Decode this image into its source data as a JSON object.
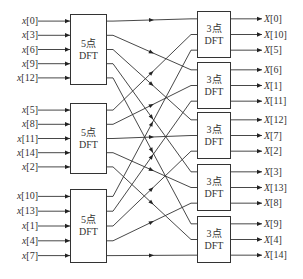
{
  "diagram": {
    "type": "signal-flow",
    "stage1": {
      "block_label_line1": "5点",
      "block_label_line2": "DFT",
      "blocks": [
        {
          "inputs": [
            "x[0]",
            "x[3]",
            "x[6]",
            "x[9]",
            "x[12]"
          ]
        },
        {
          "inputs": [
            "x[5]",
            "x[8]",
            "x[11]",
            "x[14]",
            "x[2]"
          ]
        },
        {
          "inputs": [
            "x[10]",
            "x[13]",
            "x[1]",
            "x[4]",
            "x[7]"
          ]
        }
      ]
    },
    "stage2": {
      "block_label_line1": "3点",
      "block_label_line2": "DFT",
      "blocks": [
        {
          "outputs": [
            "X[0]",
            "X[10]",
            "X[5]"
          ]
        },
        {
          "outputs": [
            "X[6]",
            "X[1]",
            "X[11]"
          ]
        },
        {
          "outputs": [
            "X[12]",
            "X[7]",
            "X[2]"
          ]
        },
        {
          "outputs": [
            "X[3]",
            "X[13]",
            "X[8]"
          ]
        },
        {
          "outputs": [
            "X[9]",
            "X[4]",
            "X[14]"
          ]
        }
      ]
    },
    "line_color": "#333333"
  }
}
